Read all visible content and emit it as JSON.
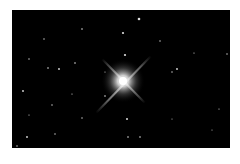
{
  "image": {
    "subject": "bright star with four diffraction spikes in a dark star field",
    "background_color": "#000000",
    "page_color": "#ffffff",
    "star_color": "#ffffff"
  }
}
